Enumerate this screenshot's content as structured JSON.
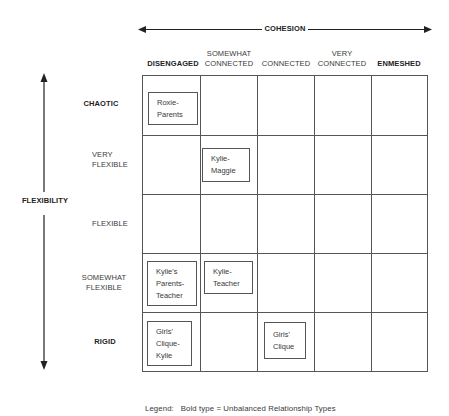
{
  "cohesion_axis": {
    "label": "COHESION",
    "columns": [
      {
        "label_line1": "",
        "label_line2": "DISENGAGED",
        "bold": true
      },
      {
        "label_line1": "SOMEWHAT",
        "label_line2": "CONNECTED",
        "bold": false
      },
      {
        "label_line1": "",
        "label_line2": "CONNECTED",
        "bold": false
      },
      {
        "label_line1": "VERY",
        "label_line2": "CONNECTED",
        "bold": false
      },
      {
        "label_line1": "",
        "label_line2": "ENMESHED",
        "bold": true
      }
    ]
  },
  "flexibility_axis": {
    "label": "FLEXIBILITY",
    "rows": [
      {
        "label_line1": "CHAOTIC",
        "label_line2": "",
        "bold": true
      },
      {
        "label_line1": "VERY",
        "label_line2": "FLEXIBLE",
        "bold": false
      },
      {
        "label_line1": "FLEXIBLE",
        "label_line2": "",
        "bold": false
      },
      {
        "label_line1": "SOMEWHAT",
        "label_line2": "FLEXIBLE",
        "bold": false
      },
      {
        "label_line1": "RIGID",
        "label_line2": "",
        "bold": true
      }
    ]
  },
  "relationships": [
    {
      "row": 0,
      "col": 0,
      "lines": [
        "Roxie-",
        "Parents"
      ]
    },
    {
      "row": 1,
      "col": 1,
      "lines": [
        "Kylie-",
        "Maggie"
      ]
    },
    {
      "row": 3,
      "col": 0,
      "lines": [
        "Kylie's",
        "Parents-",
        "Teacher"
      ]
    },
    {
      "row": 3,
      "col": 1,
      "lines": [
        "Kylie-",
        "Teacher"
      ]
    },
    {
      "row": 4,
      "col": 0,
      "lines": [
        "Girls'",
        "Clique-",
        "Kylie"
      ]
    },
    {
      "row": 4,
      "col": 2,
      "lines": [
        "Girls'",
        "Clique"
      ]
    }
  ],
  "legend": {
    "label": "Legend:",
    "text": "Bold type = Unbalanced Relationship Types"
  }
}
